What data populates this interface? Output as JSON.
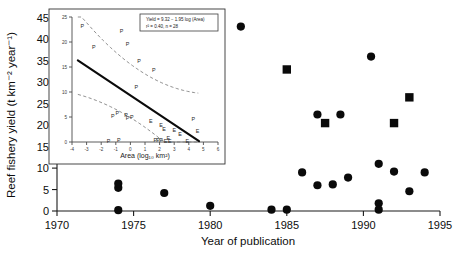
{
  "chart_data": [
    {
      "id": "main",
      "type": "scatter",
      "title": "",
      "xlabel": "Year of publication",
      "ylabel": "Reef fishery yield (t km⁻² year⁻¹)",
      "xlim": [
        1970,
        1995
      ],
      "ylim": [
        0,
        45
      ],
      "xticks": [
        1970,
        1975,
        1980,
        1985,
        1990,
        1995
      ],
      "yticks": [
        0,
        5,
        10,
        15,
        20,
        25,
        30,
        35,
        40,
        45
      ],
      "grid": false,
      "legend": "none",
      "series": [
        {
          "name": "circle-marker-series",
          "marker": "circle",
          "color": "#0a0a0a",
          "points": [
            {
              "x": 1974.0,
              "y": 0.2
            },
            {
              "x": 1974.0,
              "y": 5.4
            },
            {
              "x": 1974.0,
              "y": 6.4
            },
            {
              "x": 1977.0,
              "y": 4.2
            },
            {
              "x": 1980.0,
              "y": 1.2
            },
            {
              "x": 1982.0,
              "y": 43.0
            },
            {
              "x": 1984.0,
              "y": 0.3
            },
            {
              "x": 1985.0,
              "y": 0.3
            },
            {
              "x": 1986.0,
              "y": 9.0
            },
            {
              "x": 1987.0,
              "y": 22.5
            },
            {
              "x": 1987.0,
              "y": 6.0
            },
            {
              "x": 1988.0,
              "y": 6.2
            },
            {
              "x": 1988.5,
              "y": 22.5
            },
            {
              "x": 1989.0,
              "y": 7.8
            },
            {
              "x": 1990.5,
              "y": 36.0
            },
            {
              "x": 1991.0,
              "y": 11.0
            },
            {
              "x": 1991.0,
              "y": 1.8
            },
            {
              "x": 1991.0,
              "y": 0.3
            },
            {
              "x": 1992.0,
              "y": 9.2
            },
            {
              "x": 1993.0,
              "y": 4.6
            },
            {
              "x": 1994.0,
              "y": 9.0
            }
          ]
        },
        {
          "name": "square-marker-series",
          "marker": "square",
          "color": "#0a0a0a",
          "points": [
            {
              "x": 1985.0,
              "y": 33.0
            },
            {
              "x": 1987.5,
              "y": 20.5
            },
            {
              "x": 1992.0,
              "y": 20.5
            },
            {
              "x": 1993.0,
              "y": 26.5
            }
          ]
        }
      ]
    },
    {
      "id": "inset",
      "type": "scatter",
      "title": "",
      "xlabel": "Area (log₁₀ km²)",
      "ylabel": "",
      "xlim": [
        -4,
        6
      ],
      "ylim": [
        0,
        25
      ],
      "xticks": [
        -4,
        -3,
        -2,
        -1,
        0,
        1,
        2,
        3,
        4,
        5,
        6
      ],
      "yticks": [
        0,
        5,
        10,
        15,
        20,
        25
      ],
      "grid": false,
      "annotation_line1": "Yield = 9.32 − 1.95 log (Area)",
      "annotation_line2": "r² = 0.40, n = 28",
      "fit": {
        "intercept": 9.32,
        "slope": -1.95
      },
      "points": [
        {
          "x": -3.3,
          "y": 23.2,
          "label": "P"
        },
        {
          "x": -2.5,
          "y": 19.0,
          "label": "P"
        },
        {
          "x": -0.6,
          "y": 22.2,
          "label": "P"
        },
        {
          "x": -0.2,
          "y": 19.6,
          "label": "P"
        },
        {
          "x": 0.6,
          "y": 16.2,
          "label": "P"
        },
        {
          "x": 1.6,
          "y": 14.4,
          "label": "P"
        },
        {
          "x": 0.4,
          "y": 11.0,
          "label": "P"
        },
        {
          "x": -1.2,
          "y": 5.2,
          "label": "P"
        },
        {
          "x": -0.9,
          "y": 5.8,
          "label": "P"
        },
        {
          "x": -0.3,
          "y": 5.4,
          "label": "P"
        },
        {
          "x": -0.2,
          "y": 4.9,
          "label": "P"
        },
        {
          "x": 0.1,
          "y": 5.1,
          "label": "P"
        },
        {
          "x": 1.4,
          "y": 4.2,
          "label": "E"
        },
        {
          "x": 2.1,
          "y": 3.4,
          "label": "E"
        },
        {
          "x": 2.3,
          "y": 2.6,
          "label": "E"
        },
        {
          "x": 3.0,
          "y": 2.4,
          "label": "E"
        },
        {
          "x": 3.4,
          "y": 1.6,
          "label": "E"
        },
        {
          "x": 4.3,
          "y": 4.6,
          "label": "P"
        },
        {
          "x": 4.6,
          "y": 2.2,
          "label": "E"
        },
        {
          "x": -1.5,
          "y": 0.3,
          "label": "P"
        },
        {
          "x": -0.8,
          "y": 0.5,
          "label": "P"
        },
        {
          "x": 1.7,
          "y": 0.4,
          "label": "P"
        },
        {
          "x": 1.9,
          "y": 0.5,
          "label": "P"
        },
        {
          "x": 2.1,
          "y": 0.4,
          "label": "P"
        },
        {
          "x": 2.4,
          "y": 0.3,
          "label": "E"
        },
        {
          "x": 2.6,
          "y": 0.8,
          "label": "E"
        },
        {
          "x": 2.7,
          "y": 0.2,
          "label": "E"
        },
        {
          "x": 3.9,
          "y": 0.2,
          "label": "E"
        }
      ]
    }
  ]
}
